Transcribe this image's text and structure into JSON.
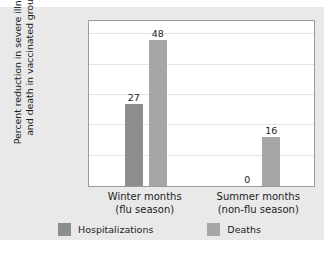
{
  "chart_data": {
    "type": "bar",
    "title": "",
    "xlabel": "",
    "ylabel": "Percent reduction in severe illness and death in vaccinated group",
    "categories": [
      "Winter months (flu season)",
      "Summer months (non-flu season)"
    ],
    "category_lines": [
      [
        "Winter months",
        "(flu season)"
      ],
      [
        "Summer months",
        "(non-flu season)"
      ]
    ],
    "series": [
      {
        "name": "Hospitalizations",
        "values": [
          27,
          0
        ],
        "color": "#8d8d8d"
      },
      {
        "name": "Deaths",
        "values": [
          48,
          16
        ],
        "color": "#a6a6a6"
      }
    ],
    "ylim": [
      0,
      55
    ],
    "yticks": [
      0,
      10,
      20,
      30,
      40,
      50
    ],
    "ytick_labels": [
      "0",
      "10",
      "20",
      "30",
      "40",
      "50"
    ],
    "grid": true,
    "grid_axis": "y",
    "legend_position": "bottom",
    "value_labels": [
      "27",
      "48",
      "0",
      "16"
    ]
  },
  "figure": {
    "background_color": "#e9e9e9",
    "plot_background_color": "#ffffff",
    "frame_color": "#9b9b9b"
  }
}
